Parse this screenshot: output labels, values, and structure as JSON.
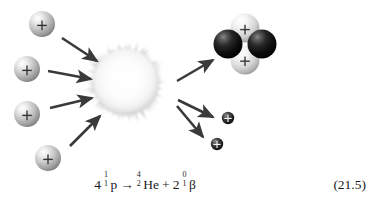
{
  "figure": {
    "background_color": "#ffffff",
    "caption_equation": {
      "coefficient_reactant": "4",
      "reactant": {
        "symbol": "p",
        "mass_number": "1",
        "atomic_number": "1"
      },
      "arrow": "→",
      "product_1": {
        "symbol": "He",
        "mass_number": "4",
        "atomic_number": "2"
      },
      "plus": "+",
      "coefficient_product_2": "2",
      "product_2": {
        "symbol": "β",
        "mass_number": "0",
        "atomic_number": "1"
      },
      "plain_text": "4 1/1 p → 4/2 He + 2 0/1 β"
    },
    "equation_number": "(21.5)",
    "colors": {
      "proton_sphere_light": "#f2f2f2",
      "proton_sphere_mid": "#b4b4b4",
      "proton_sphere_dark": "#7a7a7a",
      "neutron_sphere_dark": "#151515",
      "neutron_sphere_highlight": "#6f6f6f",
      "burst_fill": "#fbfbfb",
      "burst_edge": "#9a9a9a",
      "arrow_color": "#3a3a3a",
      "charge_symbol": "#222222",
      "text_color": "#1b1b1b"
    },
    "reactants": {
      "label": "incoming-protons",
      "count": 4,
      "charge_symbol": "+",
      "items": [
        {
          "name": "proton-1",
          "cx": 42,
          "cy": 24,
          "r": 13
        },
        {
          "name": "proton-2",
          "cx": 27,
          "cy": 69,
          "r": 13
        },
        {
          "name": "proton-3",
          "cx": 27,
          "cy": 114,
          "r": 13
        },
        {
          "name": "proton-4",
          "cx": 48,
          "cy": 158,
          "r": 13
        }
      ]
    },
    "fusion_burst": {
      "label": "fusion-burst",
      "cx": 126,
      "cy": 82,
      "r": 40,
      "spikes": 64
    },
    "products": {
      "helium_nucleus": {
        "label": "helium-4-nucleus",
        "cx": 245,
        "cy": 44,
        "protons": [
          {
            "name": "helium-proton-top",
            "cx": 245,
            "cy": 28,
            "r": 14,
            "charge_symbol": "+"
          },
          {
            "name": "helium-proton-bottom",
            "cx": 245,
            "cy": 59,
            "r": 14,
            "charge_symbol": "+"
          }
        ],
        "neutrons": [
          {
            "name": "helium-neutron-left",
            "cx": 229,
            "cy": 44,
            "r": 14
          },
          {
            "name": "helium-neutron-right",
            "cx": 261,
            "cy": 44,
            "r": 14
          }
        ]
      },
      "beta_particles": {
        "label": "emitted-positrons",
        "count": 2,
        "charge_symbol": "+",
        "items": [
          {
            "name": "beta-particle-1",
            "cx": 228,
            "cy": 118,
            "r": 6
          },
          {
            "name": "beta-particle-2",
            "cx": 217,
            "cy": 144,
            "r": 6
          }
        ]
      }
    },
    "arrows": {
      "incoming": [
        {
          "name": "arrow-in-1",
          "x1": 62,
          "y1": 38,
          "x2": 100,
          "y2": 63
        },
        {
          "name": "arrow-in-2",
          "x1": 48,
          "y1": 71,
          "x2": 94,
          "y2": 80
        },
        {
          "name": "arrow-in-3",
          "x1": 50,
          "y1": 107,
          "x2": 95,
          "y2": 97
        },
        {
          "name": "arrow-in-4",
          "x1": 70,
          "y1": 145,
          "x2": 103,
          "y2": 113
        }
      ],
      "outgoing": [
        {
          "name": "arrow-out-helium",
          "x1": 177,
          "y1": 80,
          "x2": 216,
          "y2": 58
        },
        {
          "name": "arrow-out-beta-1",
          "x1": 178,
          "y1": 100,
          "x2": 215,
          "y2": 118
        },
        {
          "name": "arrow-out-beta-2",
          "x1": 177,
          "y1": 105,
          "x2": 205,
          "y2": 139
        }
      ]
    }
  }
}
